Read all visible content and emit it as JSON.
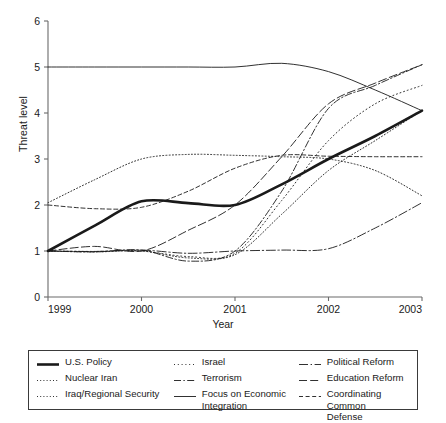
{
  "chart_data": {
    "type": "line",
    "title": "",
    "xlabel": "Year",
    "ylabel": "Threat level",
    "xlim": [
      1999,
      2003
    ],
    "ylim": [
      0,
      6
    ],
    "yticks": [
      0,
      1,
      2,
      3,
      4,
      5,
      6
    ],
    "xticks": [
      "1999",
      "2000",
      "2001",
      "2002",
      "2003"
    ],
    "grid": false,
    "legend_position": "bottom",
    "x": [
      1999,
      1999.5,
      2000,
      2000.5,
      2001,
      2001.5,
      2002,
      2002.5,
      2003
    ],
    "series": [
      {
        "name": "U.S. Policy",
        "style": "solid-thick",
        "values": [
          1.0,
          1.55,
          2.08,
          2.04,
          2.0,
          2.45,
          3.0,
          3.5,
          4.05
        ]
      },
      {
        "name": "Nuclear Iran",
        "style": "dotted",
        "values": [
          1.0,
          0.98,
          1.0,
          0.85,
          0.92,
          1.8,
          2.75,
          3.4,
          4.05
        ]
      },
      {
        "name": "Iraq/Regional Security",
        "style": "dotted",
        "values": [
          2.05,
          2.55,
          3.0,
          3.1,
          3.08,
          3.05,
          3.0,
          2.75,
          2.2
        ]
      },
      {
        "name": "Israel",
        "style": "dotted-fine",
        "values": [
          1.0,
          0.99,
          1.0,
          0.88,
          0.95,
          2.1,
          3.4,
          4.2,
          4.6
        ]
      },
      {
        "name": "Terrorism",
        "style": "dash-dot",
        "values": [
          1.0,
          0.98,
          1.02,
          0.78,
          1.0,
          2.3,
          4.1,
          4.6,
          5.05
        ]
      },
      {
        "name": "Focus on Economic Integration",
        "style": "solid-thin",
        "values": [
          5.0,
          5.0,
          5.0,
          5.0,
          5.0,
          5.08,
          4.9,
          4.5,
          4.05
        ]
      },
      {
        "name": "Political Reform",
        "style": "dash-dot-long",
        "values": [
          1.0,
          0.99,
          1.02,
          0.95,
          1.0,
          1.02,
          1.05,
          1.5,
          2.05
        ]
      },
      {
        "name": "Education Reform",
        "style": "long-dash",
        "values": [
          1.0,
          1.1,
          1.0,
          1.45,
          2.0,
          3.05,
          4.2,
          4.65,
          5.05
        ]
      },
      {
        "name": "Coordinating Common Defense",
        "style": "dashed",
        "values": [
          2.0,
          1.92,
          1.95,
          2.3,
          2.8,
          3.08,
          3.06,
          3.05,
          3.05
        ]
      }
    ]
  },
  "legend": {
    "columns": [
      [
        {
          "label": "U.S. Policy",
          "style": "solid-thick"
        },
        {
          "label": "Nuclear Iran",
          "style": "dotted"
        },
        {
          "label": "Iraq/Regional Security",
          "style": "dotted"
        }
      ],
      [
        {
          "label": "Israel",
          "style": "dotted-fine"
        },
        {
          "label": "Terrorism",
          "style": "dash-dot"
        },
        {
          "label": "Focus on Economic\nIntegration",
          "style": "solid-thin"
        }
      ],
      [
        {
          "label": "Political Reform",
          "style": "dash-dot-long"
        },
        {
          "label": "Education Reform",
          "style": "long-dash"
        },
        {
          "label": "Coordinating Common\nDefense",
          "style": "dashed"
        }
      ]
    ]
  },
  "colors": {
    "line": "#1a1a1a",
    "axis": "#6b6b6b",
    "text": "#1a1a1a",
    "background": "#ffffff"
  }
}
